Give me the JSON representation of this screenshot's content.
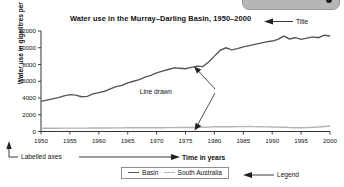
{
  "window": {
    "topbar_present": true,
    "topbar_dot_icon": "dot-icon"
  },
  "annotations": {
    "title_callout": "Title",
    "line_drawn_callout": "Line drawn",
    "labelled_axes_callout": "Labelled axes",
    "time_axis_callout": "Time in years",
    "legend_callout": "Legend"
  },
  "legend": {
    "items": [
      {
        "label": "Basin",
        "color": "#555555"
      },
      {
        "label": "South Australia",
        "color": "#b4b4b4"
      }
    ]
  },
  "chart_data": {
    "type": "line",
    "title": "Water use in the Murray–Darling Basin, 1950–2000",
    "xlabel": "Time in years",
    "ylabel": "Water use in gigalitres per year",
    "xlim": [
      1950,
      2000
    ],
    "ylim": [
      0,
      12000
    ],
    "xticks": [
      1950,
      1955,
      1960,
      1965,
      1970,
      1975,
      1980,
      1985,
      1990,
      1995,
      2000
    ],
    "xtick_labels": [
      "1950",
      "1955",
      "1960",
      "1965",
      "1970",
      "1975",
      "1980",
      "1985",
      "1990",
      "1995",
      "2000"
    ],
    "yticks": [
      0,
      2000,
      4000,
      6000,
      8000,
      10000,
      12000
    ],
    "ytick_labels": [
      "0",
      "2000",
      "4000",
      "6000",
      "8000",
      "10000",
      "12000"
    ],
    "grid": false,
    "legend_position": "bottom",
    "x": [
      1950,
      1951,
      1952,
      1953,
      1954,
      1955,
      1956,
      1957,
      1958,
      1959,
      1960,
      1961,
      1962,
      1963,
      1964,
      1965,
      1966,
      1967,
      1968,
      1969,
      1970,
      1971,
      1972,
      1973,
      1974,
      1975,
      1976,
      1977,
      1978,
      1979,
      1980,
      1981,
      1982,
      1983,
      1984,
      1985,
      1986,
      1987,
      1988,
      1989,
      1990,
      1991,
      1992,
      1993,
      1994,
      1995,
      1996,
      1997,
      1998,
      1999,
      2000
    ],
    "series": [
      {
        "name": "Basin",
        "color": "#555555",
        "values": [
          3600,
          3750,
          3900,
          4050,
          4250,
          4400,
          4350,
          4150,
          4200,
          4500,
          4650,
          4800,
          5100,
          5350,
          5500,
          5800,
          6000,
          6200,
          6500,
          6700,
          7000,
          7200,
          7400,
          7600,
          7550,
          7500,
          7650,
          7800,
          7750,
          8300,
          9000,
          9700,
          10000,
          9750,
          9900,
          10100,
          10250,
          10400,
          10550,
          10700,
          10800,
          11000,
          11400,
          11050,
          11200,
          11000,
          11150,
          11300,
          11200,
          11500,
          11400
        ]
      },
      {
        "name": "South Australia",
        "color": "#b4b4b4",
        "values": [
          380,
          385,
          390,
          395,
          400,
          405,
          405,
          400,
          405,
          410,
          415,
          420,
          425,
          430,
          435,
          440,
          445,
          450,
          440,
          445,
          450,
          455,
          460,
          465,
          470,
          475,
          480,
          490,
          500,
          520,
          560,
          570,
          575,
          570,
          580,
          585,
          590,
          580,
          570,
          555,
          540,
          525,
          510,
          470,
          450,
          440,
          460,
          500,
          540,
          600,
          660
        ]
      }
    ]
  }
}
